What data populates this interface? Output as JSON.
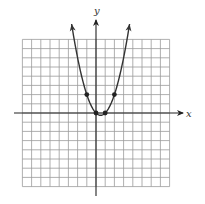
{
  "chart_data": {
    "type": "line",
    "title": "",
    "xlabel": "x",
    "ylabel": "y",
    "xlim": [
      -8,
      8
    ],
    "ylim": [
      -8,
      8
    ],
    "grid": true,
    "grid_step": 1,
    "tick_labels": false,
    "legend": null,
    "function": "y = x^2 - x",
    "series": [
      {
        "name": "parabola",
        "x": [
          -2.65,
          -2,
          -1.5,
          -1,
          -0.5,
          0,
          0.5,
          1,
          1.5,
          2,
          2.5,
          3,
          3.65
        ],
        "y": [
          9.67,
          6,
          3.75,
          2,
          0.75,
          0,
          -0.25,
          0,
          0.75,
          2,
          3.75,
          6,
          9.67
        ],
        "arrows_at_ends": true
      }
    ],
    "marked_points": [
      {
        "x": -1,
        "y": 2
      },
      {
        "x": 0,
        "y": 0
      },
      {
        "x": 1,
        "y": 0
      },
      {
        "x": 2,
        "y": 2
      }
    ]
  },
  "labels": {
    "x_axis": "x",
    "y_axis": "y"
  },
  "colors": {
    "grid": "#9a9a9a",
    "axis": "#222222",
    "curve": "#333333",
    "points": "#222222"
  }
}
